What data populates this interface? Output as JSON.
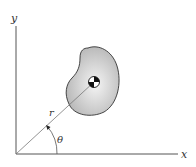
{
  "diagram": {
    "type": "polar-coordinates-centroid",
    "labels": {
      "y_axis": "y",
      "x_axis": "x",
      "radius": "r",
      "angle": "θ"
    },
    "colors": {
      "axis": "#555555",
      "body_fill_center": "#f2f2f2",
      "body_fill_edge": "#b8b8b8",
      "body_outline": "#333333",
      "radius_line": "#777777",
      "centroid_dark": "#111111",
      "centroid_light": "#ffffff"
    },
    "elements": {
      "origin": {
        "x": 16,
        "y": 154
      },
      "centroid": {
        "x": 94,
        "y": 82
      },
      "x_axis_end": {
        "x": 178,
        "y": 154
      },
      "y_axis_end": {
        "x": 16,
        "y": 25
      }
    }
  }
}
